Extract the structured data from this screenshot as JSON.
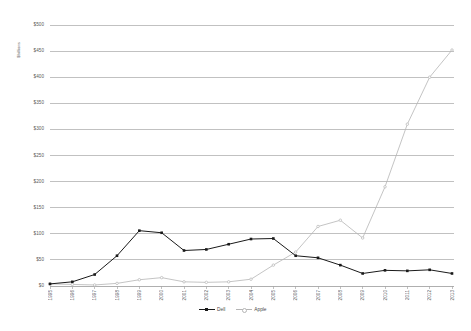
{
  "chart_data": {
    "type": "line",
    "title": "",
    "xlabel": "",
    "ylabel": "$billions",
    "ylim": [
      0,
      500
    ],
    "ytick_values": [
      0,
      50,
      100,
      150,
      200,
      250,
      300,
      350,
      400,
      450,
      500
    ],
    "ytick_labels": [
      "$0",
      "$50",
      "$100",
      "$150",
      "$200",
      "$250",
      "$300",
      "$350",
      "$400",
      "$450",
      "$500"
    ],
    "categories": [
      "1995",
      "1996",
      "1997",
      "1998",
      "1999",
      "2000",
      "2001",
      "2002",
      "2003",
      "2004",
      "2005",
      "2006",
      "2007",
      "2008",
      "2009",
      "2010",
      "2011",
      "2012",
      "2013"
    ],
    "grid": true,
    "legend_position": "bottom",
    "series": [
      {
        "name": "Dell",
        "color": "#1a1a1a",
        "marker": "square",
        "values": [
          4,
          8,
          22,
          58,
          106,
          102,
          68,
          70,
          80,
          90,
          91,
          58,
          54,
          40,
          24,
          30,
          29,
          31,
          24
        ]
      },
      {
        "name": "Apple",
        "color": "#b5b5b5",
        "marker": "circle",
        "values": [
          4,
          3,
          2,
          5,
          12,
          16,
          8,
          7,
          8,
          13,
          40,
          65,
          114,
          126,
          92,
          190,
          310,
          400,
          452
        ]
      }
    ]
  },
  "legend": {
    "entries": [
      {
        "label": "Dell"
      },
      {
        "label": "Apple"
      }
    ]
  },
  "colors": {
    "dell": "#1a1a1a",
    "apple": "#b5b5b5",
    "grid": "#a6a6a6",
    "text": "#595959"
  }
}
